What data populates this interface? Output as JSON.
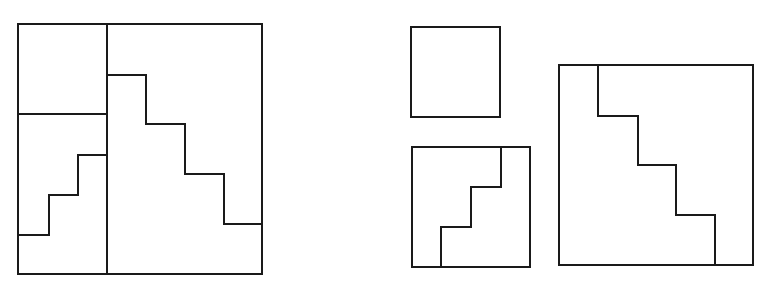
{
  "diagram": {
    "title": "",
    "stroke_color": "#1a1a1a",
    "background": "#ffffff",
    "left_figure": {
      "outer_square": {
        "x": 18,
        "y": 24,
        "w": 244,
        "h": 250
      },
      "vertical_divider": {
        "x1": 107,
        "y1": 24,
        "x2": 107,
        "y2": 274
      },
      "horizontal_divider": {
        "x1": 18,
        "y1": 114,
        "x2": 107,
        "y2": 114
      },
      "small_staircase": "M19,235 L49,235 L49,195 L78,195 L78,155 L107,155",
      "large_staircase": "M107,75 L146,75 L146,124 L185,124 L185,174 L224,174 L224,224 L262,224"
    },
    "right_figures": {
      "small_square": {
        "x": 411,
        "y": 27,
        "w": 89,
        "h": 90
      },
      "middle_square": {
        "x": 412,
        "y": 147,
        "w": 118,
        "h": 120
      },
      "middle_staircase": "M441,267 L441,227 L471,227 L471,187 L501,187 L501,147",
      "large_square": {
        "x": 559,
        "y": 65,
        "w": 194,
        "h": 200
      },
      "large_staircase": "M598,65 L598,116 L638,116 L638,165 L676,165 L676,215 L715,215 L715,265"
    }
  }
}
